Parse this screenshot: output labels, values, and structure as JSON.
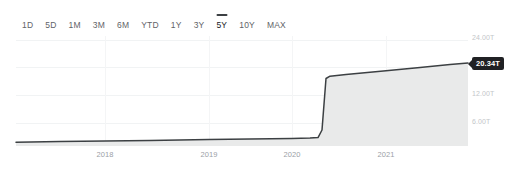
{
  "range_selector": {
    "options": [
      {
        "label": "1D",
        "selected": false
      },
      {
        "label": "5D",
        "selected": false
      },
      {
        "label": "1M",
        "selected": false
      },
      {
        "label": "3M",
        "selected": false
      },
      {
        "label": "6M",
        "selected": false
      },
      {
        "label": "YTD",
        "selected": false
      },
      {
        "label": "1Y",
        "selected": false
      },
      {
        "label": "3Y",
        "selected": false
      },
      {
        "label": "5Y",
        "selected": true
      },
      {
        "label": "10Y",
        "selected": false
      },
      {
        "label": "MAX",
        "selected": false
      }
    ],
    "selected_value": "5Y"
  },
  "price_flag": {
    "value": "20.34T"
  },
  "colors": {
    "line": "#3c4043",
    "area_fill": "#e9eaea",
    "gridline": "#f1f3f4",
    "axis_text": "#9aa0a6",
    "y_axis_text": "#c3c6c9",
    "flag_bg": "#202124",
    "flag_text": "#ffffff",
    "background": "#ffffff"
  },
  "chart_data": {
    "type": "area",
    "title": "",
    "subtitle": "",
    "xlabel": "",
    "ylabel": "",
    "grid": true,
    "legend": null,
    "x_tick_labels": [
      "2018",
      "2019",
      "2020",
      "2021"
    ],
    "x_tick_positions_px": [
      105,
      209,
      292,
      386
    ],
    "y_tick_labels": [
      "24.00T",
      "18.00T",
      "12.00T",
      "6.00T"
    ],
    "y_tick_values": [
      24.0,
      18.0,
      12.0,
      6.0
    ],
    "ylim": [
      0,
      26
    ],
    "y_unit": "T",
    "last_value": 20.34,
    "last_value_label": "20.34T",
    "series": [
      {
        "name": "Total value",
        "x": [
          "2017-01",
          "2017-07",
          "2018-01",
          "2018-07",
          "2019-01",
          "2019-07",
          "2020-01",
          "2020-04",
          "2020-06",
          "2020-07",
          "2020-10",
          "2021-01",
          "2021-07",
          "2021-12",
          "2022-03"
        ],
        "values": [
          0.3,
          0.38,
          0.46,
          0.55,
          0.64,
          0.74,
          0.85,
          0.95,
          15.4,
          16.1,
          16.9,
          17.7,
          18.7,
          19.7,
          20.34
        ]
      }
    ],
    "annotations": [
      {
        "type": "price_flag",
        "text": "20.34T",
        "value": 20.34,
        "position": "right-edge"
      }
    ]
  }
}
